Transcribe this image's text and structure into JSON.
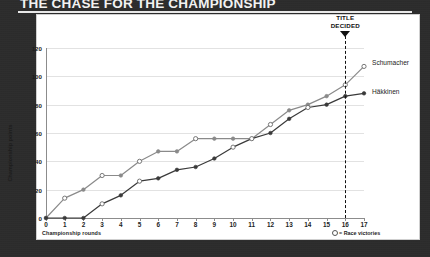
{
  "headline": "THE CHASE FOR THE CHAMPIONSHIP",
  "annotation": {
    "title_decided_line1": "TITLE",
    "title_decided_line2": "DECIDED",
    "title_decided_round": 16
  },
  "legend": {
    "note": "= Race victories",
    "schumacher_label": "Schumacher",
    "hakkinen_label": "Häkkinen"
  },
  "colors": {
    "page_background": "#2c2c2c",
    "card_background": "#ffffff",
    "headline_text": "#f2f2f2",
    "schumacher_line": "#8a8a8a",
    "hakkinen_line": "#3a3a3a",
    "gridline": "#e2e2e2",
    "axis": "#8c8c8c"
  },
  "chart_data": {
    "type": "line",
    "title": "THE CHASE FOR THE CHAMPIONSHIP",
    "xlabel": "Championship rounds",
    "ylabel": "Championship points",
    "xlim": [
      0,
      17
    ],
    "ylim": [
      0,
      120
    ],
    "ytick_labels": [
      "0",
      "20",
      "40",
      "60",
      "80",
      "100",
      "120"
    ],
    "yticks": [
      0,
      20,
      40,
      60,
      80,
      100,
      120
    ],
    "xticks": [
      0,
      1,
      2,
      3,
      4,
      5,
      6,
      7,
      8,
      9,
      10,
      11,
      12,
      13,
      14,
      15,
      16,
      17
    ],
    "xtick_labels": [
      "0",
      "1",
      "2",
      "3",
      "4",
      "5",
      "6",
      "7",
      "8",
      "9",
      "10",
      "11",
      "12",
      "13",
      "14",
      "15",
      "16",
      "17"
    ],
    "grid": true,
    "legend_position": "right",
    "x": [
      0,
      1,
      2,
      3,
      4,
      5,
      6,
      7,
      8,
      9,
      10,
      11,
      12,
      13,
      14,
      15,
      16,
      17
    ],
    "series": [
      {
        "name": "Schumacher",
        "color": "#8a8a8a",
        "marker": "open-circle-on-win",
        "values": [
          0,
          14,
          20,
          30,
          30,
          40,
          47,
          47,
          56,
          56,
          56,
          56,
          66,
          76,
          80,
          86,
          94,
          107
        ],
        "victories": [
          1,
          3,
          5,
          8,
          12,
          16,
          17
        ]
      },
      {
        "name": "Häkkinen",
        "color": "#3a3a3a",
        "marker": "open-circle-on-win",
        "values": [
          0,
          0,
          0,
          10,
          16,
          26,
          28,
          34,
          36,
          42,
          50,
          56,
          60,
          70,
          78,
          80,
          86,
          88
        ],
        "victories": [
          3,
          5,
          10,
          11,
          14
        ]
      }
    ]
  }
}
